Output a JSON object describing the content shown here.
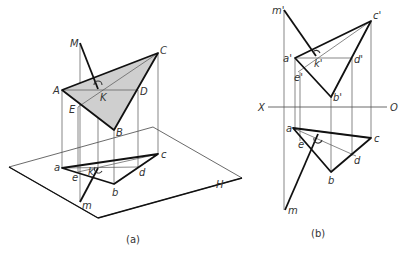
{
  "figure": {
    "panel_a": {
      "caption": "(a)",
      "plane_label": "H",
      "space_points": {
        "M": "M",
        "C": "C",
        "A": "A",
        "D": "D",
        "K": "K",
        "E": "E",
        "B": "B"
      },
      "projected_points": {
        "a": "a",
        "c": "c",
        "d": "d",
        "e": "e",
        "k": "k",
        "b": "b",
        "m": "m"
      },
      "shade_color": "#cfcfcf"
    },
    "panel_b": {
      "caption": "(b)",
      "axis": {
        "left": "X",
        "right": "O"
      },
      "front_view_points": {
        "m1": "m'",
        "c1": "c'",
        "a1": "a'",
        "k1": "k'",
        "d1": "d'",
        "e1": "e'",
        "b1": "b'"
      },
      "top_view_points": {
        "a": "a",
        "k": "k",
        "c": "c",
        "e": "e",
        "d": "d",
        "b": "b",
        "m": "m"
      }
    }
  }
}
